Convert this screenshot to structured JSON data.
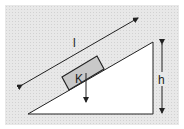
{
  "diagram": {
    "labels": {
      "length": "l",
      "height": "h",
      "block": "K"
    },
    "colors": {
      "background": "#e4e4e4",
      "frame": "#ffffff",
      "triangle_fill": "#ffffff",
      "block_fill": "#c8c8c8",
      "stroke": "#222222"
    }
  }
}
